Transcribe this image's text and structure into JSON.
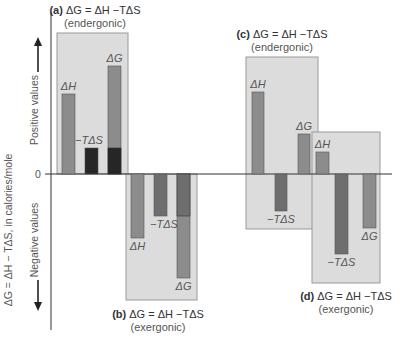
{
  "figure": {
    "y_axis_label": "ΔG = ΔH − TΔS, in calories/mole",
    "positive_label": "Positive values",
    "negative_label": "Negative values",
    "zero_label": "0",
    "colors": {
      "panel_bg": "#dcdcdc",
      "panel_border": "#9a9a9a",
      "bar_light": "#8c8c8c",
      "bar_mid": "#6e6e6e",
      "bar_dark": "#262626",
      "axis": "#333333"
    },
    "panels": [
      {
        "id": "a",
        "letter": "(a)",
        "equation": "ΔG = ΔH −TΔS",
        "type": "(endergonic)",
        "bars": [
          {
            "label": "ΔH",
            "value": 80
          },
          {
            "label": "−TΔS",
            "value": 26
          },
          {
            "label": "ΔG",
            "value": 108,
            "stacked_part": 26
          }
        ]
      },
      {
        "id": "b",
        "letter": "(b)",
        "equation": "ΔG = ΔH −TΔS",
        "type": "(exergonic)",
        "bars": [
          {
            "label": "ΔH",
            "value": -64
          },
          {
            "label": "−TΔS",
            "value": -42
          },
          {
            "label": "ΔG",
            "value": -104,
            "stacked_part": -42
          }
        ]
      },
      {
        "id": "c",
        "letter": "(c)",
        "equation": "ΔG = ΔH −TΔS",
        "type": "(endergonic)",
        "bars": [
          {
            "label": "ΔH",
            "value": 82
          },
          {
            "label": "−TΔS",
            "value": -37
          },
          {
            "label": "ΔG",
            "value": 40
          }
        ]
      },
      {
        "id": "d",
        "letter": "(d)",
        "equation": "ΔG = ΔH −TΔS",
        "type": "(exergonic)",
        "bars": [
          {
            "label": "ΔH",
            "value": 22
          },
          {
            "label": "−TΔS",
            "value": -80
          },
          {
            "label": "ΔG",
            "value": -54
          }
        ]
      }
    ]
  }
}
